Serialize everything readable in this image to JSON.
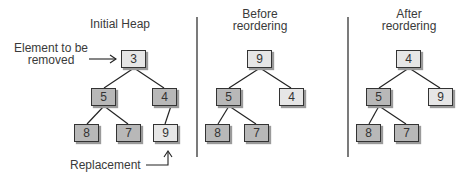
{
  "panels": [
    {
      "title": "Initial Heap",
      "nodes": [
        {
          "value": "3",
          "shade": "light"
        },
        {
          "value": "5",
          "shade": "dark"
        },
        {
          "value": "4",
          "shade": "dark"
        },
        {
          "value": "8",
          "shade": "dark"
        },
        {
          "value": "7",
          "shade": "dark"
        },
        {
          "value": "9",
          "shade": "light"
        }
      ],
      "annotations": {
        "removed": [
          "Element to be",
          "removed"
        ],
        "replacement": "Replacement"
      }
    },
    {
      "title_lines": [
        "Before",
        "reordering"
      ],
      "nodes": [
        {
          "value": "9",
          "shade": "light"
        },
        {
          "value": "5",
          "shade": "dark"
        },
        {
          "value": "4",
          "shade": "light"
        },
        {
          "value": "8",
          "shade": "dark"
        },
        {
          "value": "7",
          "shade": "dark"
        }
      ]
    },
    {
      "title_lines": [
        "After",
        "reordering"
      ],
      "nodes": [
        {
          "value": "4",
          "shade": "light"
        },
        {
          "value": "5",
          "shade": "dark"
        },
        {
          "value": "9",
          "shade": "light"
        },
        {
          "value": "8",
          "shade": "dark"
        },
        {
          "value": "7",
          "shade": "dark"
        }
      ]
    }
  ],
  "colors": {
    "dark_node": "#b8b8b8",
    "light_node": "#e6e6e6",
    "line": "#222222"
  }
}
